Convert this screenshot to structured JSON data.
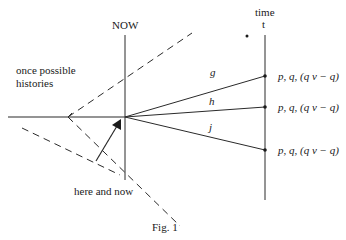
{
  "figure": {
    "caption": "Fig. 1",
    "labels": {
      "now": "NOW",
      "time": "time",
      "t": "t",
      "once_possible_line1": "once possible",
      "once_possible_line2": "histories",
      "here_and_now": "here and now"
    },
    "branches": [
      {
        "name": "g",
        "end_y": 76,
        "formula": "p, q, (q v − q)"
      },
      {
        "name": "h",
        "end_y": 107,
        "formula": "p, q, (q v − q)"
      },
      {
        "name": "j",
        "end_y": 150,
        "formula": "p, q, (q v − q)"
      }
    ],
    "colors": {
      "line": "#2a2a2a",
      "text": "#1a1a1a",
      "background": "#ffffff"
    }
  }
}
